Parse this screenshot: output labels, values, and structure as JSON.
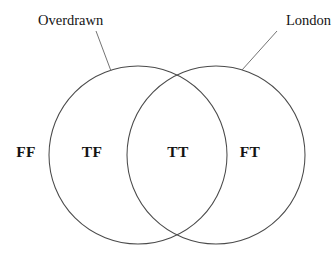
{
  "canvas": {
    "width": 336,
    "height": 256,
    "background": "#ffffff"
  },
  "diagram": {
    "type": "venn-2-set",
    "title": "",
    "stroke_color": "#4a4a4a",
    "text_color": "#141414",
    "leader_color": "#6b6b6b"
  },
  "sets": {
    "left": {
      "name": "Overdrawn",
      "callout_label": "Overdrawn",
      "cx": 138,
      "cy": 155,
      "r": 89
    },
    "right": {
      "name": "London",
      "callout_label": "London",
      "cx": 216,
      "cy": 155,
      "r": 89
    }
  },
  "regions": [
    {
      "key": "outside",
      "label": "FF",
      "meaning": "not Overdrawn, not London",
      "x": 26,
      "y": 153
    },
    {
      "key": "left-only",
      "label": "TF",
      "meaning": "Overdrawn only",
      "x": 92,
      "y": 153
    },
    {
      "key": "intersection",
      "label": "TT",
      "meaning": "Overdrawn and London",
      "x": 178,
      "y": 153
    },
    {
      "key": "right-only",
      "label": "FT",
      "meaning": "London only",
      "x": 250,
      "y": 153
    }
  ],
  "callouts": [
    {
      "key": "overdrawn-callout",
      "label": "Overdrawn",
      "text_x": 38,
      "text_y": 25,
      "line_x1": 96,
      "line_y1": 31,
      "line_x2": 111,
      "line_y2": 71
    },
    {
      "key": "london-callout",
      "label": "London",
      "text_x": 331,
      "text_y": 25,
      "line_x1": 277,
      "line_y1": 31,
      "line_x2": 242,
      "line_y2": 70
    }
  ]
}
